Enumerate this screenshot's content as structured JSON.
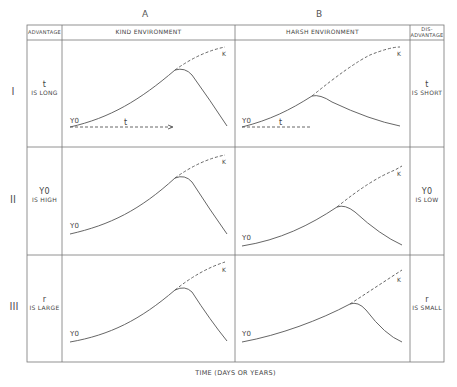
{
  "columns": {
    "a_letter": "A",
    "b_letter": "B",
    "advantage": "ADVANTAGE",
    "kind": "KIND ENVIRONMENT",
    "harsh": "HARSH ENVIRONMENT",
    "disadvantage_1": "DIS-",
    "disadvantage_2": "ADVANTAGE"
  },
  "rows": [
    {
      "roman": "I",
      "adv_sym": "t",
      "adv_text": "IS LONG",
      "dis_sym": "t",
      "dis_text": "IS SHORT"
    },
    {
      "roman": "II",
      "adv_sym": "Y0",
      "adv_text": "IS HIGH",
      "dis_sym": "Y0",
      "dis_text": "IS LOW"
    },
    {
      "roman": "III",
      "adv_sym": "r",
      "adv_text": "IS LARGE",
      "dis_sym": "r",
      "dis_text": "IS SMALL"
    }
  ],
  "curve_labels": {
    "k": "K",
    "y0": "Y0",
    "t": "t"
  },
  "xaxis_label": "TIME   (DAYS OR YEARS)"
}
